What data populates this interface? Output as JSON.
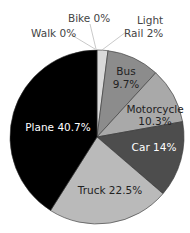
{
  "chart_data": {
    "type": "pie",
    "title": "",
    "start_angle_deg": 0,
    "direction": "clockwise",
    "slices": [
      {
        "label": "Light Rail",
        "value": 2.0,
        "display": "Light Rail 2%",
        "color": "#d9d9d9"
      },
      {
        "label": "Bus",
        "value": 9.7,
        "display": "Bus 9.7%",
        "color": "#8c8c8c"
      },
      {
        "label": "Motorcycle",
        "value": 10.3,
        "display": "Motorcycle 10.3%",
        "color": "#a9a9a9"
      },
      {
        "label": "Car",
        "value": 14.0,
        "display": "Car 14%",
        "color": "#4d4d4d"
      },
      {
        "label": "Truck",
        "value": 22.5,
        "display": "Truck 22.5%",
        "color": "#bababa"
      },
      {
        "label": "Plane",
        "value": 40.7,
        "display": "Plane 40.7%",
        "color": "#000000"
      },
      {
        "label": "Walk",
        "value": 0,
        "display": "Walk 0%",
        "color": "#ffffff"
      },
      {
        "label": "Bike",
        "value": 0,
        "display": "Bike 0%",
        "color": "#ffffff"
      }
    ],
    "legend": "none (direct labels)"
  },
  "labels": {
    "walk": "Walk 0%",
    "bike": "Bike 0%",
    "light_rail_1": "Light",
    "light_rail_2": "Rail 2%",
    "bus_1": "Bus",
    "bus_2": "9.7%",
    "motorcycle_1": "Motorcycle",
    "motorcycle_2": "10.3%",
    "car": "Car 14%",
    "truck": "Truck 22.5%",
    "plane": "Plane 40.7%"
  }
}
